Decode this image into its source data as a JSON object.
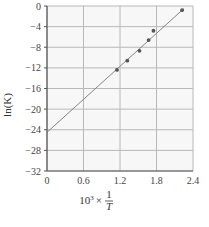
{
  "chart_data": {
    "type": "scatter",
    "title": "",
    "xlabel": "10^3 × 1/T",
    "xlabel_parts": {
      "prefix": "10",
      "exp": "3",
      "times": "×",
      "num": "1",
      "den": "T"
    },
    "ylabel": "ln(K)",
    "xlim": [
      0,
      2.4
    ],
    "ylim": [
      -32,
      0
    ],
    "x_ticks": [
      0,
      0.6,
      1.2,
      1.8,
      2.4
    ],
    "x_tick_labels": [
      "0",
      "0.6",
      "1.2",
      "1.8",
      "2.4"
    ],
    "y_ticks": [
      0,
      -4,
      -8,
      -12,
      -16,
      -20,
      -24,
      -28,
      -32
    ],
    "y_tick_labels": [
      "0",
      "−4",
      "−8",
      "−12",
      "−16",
      "−20",
      "−24",
      "−28",
      "−32"
    ],
    "grid": true,
    "legend": null,
    "series": [
      {
        "name": "data",
        "type": "scatter",
        "x": [
          1.15,
          1.32,
          1.52,
          1.67,
          1.75,
          2.22
        ],
        "y": [
          -12.4,
          -10.6,
          -8.7,
          -6.6,
          -4.8,
          -0.8
        ]
      },
      {
        "name": "linear fit",
        "type": "line",
        "x": [
          0,
          2.25
        ],
        "y": [
          -24.5,
          -0.5
        ]
      }
    ],
    "colors": {
      "grid": "#b8b8b8",
      "axis": "#555555",
      "point": "#555555",
      "line": "#777777",
      "plot_bg": "#f7f7f7"
    }
  }
}
